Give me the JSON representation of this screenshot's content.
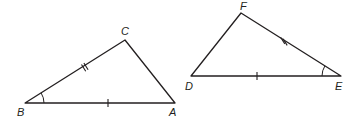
{
  "diagram": {
    "type": "congruent-triangles",
    "stroke_color": "#231f20",
    "background": "#ffffff",
    "triangles": [
      {
        "name": "triangle-abc",
        "vertices": {
          "B": {
            "label": "B",
            "x": 25,
            "y": 103
          },
          "A": {
            "label": "A",
            "x": 175,
            "y": 103
          },
          "C": {
            "label": "C",
            "x": 125,
            "y": 40
          }
        },
        "markings": {
          "side_BA": "single tick",
          "side_BC": "double tick",
          "angle_B": "single arc"
        }
      },
      {
        "name": "triangle-def",
        "vertices": {
          "D": {
            "label": "D",
            "x": 191,
            "y": 76
          },
          "E": {
            "label": "E",
            "x": 341,
            "y": 76
          },
          "F": {
            "label": "F",
            "x": 241,
            "y": 13
          }
        },
        "markings": {
          "side_DE": "single tick",
          "side_EF": "double tick",
          "angle_E": "single arc"
        }
      }
    ]
  }
}
